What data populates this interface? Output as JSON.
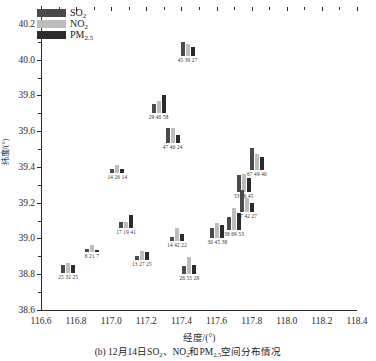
{
  "chart_data": {
    "type": "scatter",
    "title": "",
    "caption_prefix": "(b) 12月14日SO",
    "caption_mid": "、NO",
    "caption_suffix": "和PM",
    "caption_tail": "空间分布情况",
    "xlabel": "经度/(°)",
    "ylabel": "纬度/(°)",
    "xlim": [
      116.6,
      118.4
    ],
    "ylim": [
      38.6,
      40.3
    ],
    "xticks": [
      "116.6",
      "116.8",
      "117.0",
      "117.2",
      "117.4",
      "117.6",
      "117.8",
      "118.0",
      "118.2",
      "118.4"
    ],
    "yticks": [
      "38.6",
      "38.8",
      "39.0",
      "39.2",
      "39.4",
      "39.6",
      "39.8",
      "40.0",
      "40.2"
    ],
    "grid": false,
    "legend_position": "top-left",
    "series": [
      {
        "name": "SO",
        "sub": "2",
        "color": "#4a4a4a"
      },
      {
        "name": "NO",
        "sub": "2",
        "color": "#bdbdbd"
      },
      {
        "name": "PM",
        "sub": "2.5",
        "color": "#2b2b2b"
      }
    ],
    "value_max": 69,
    "points": [
      {
        "lon": 116.755,
        "lat": 38.805,
        "label": "25 32 25",
        "values": [
          25,
          32,
          25
        ]
      },
      {
        "lon": 116.89,
        "lat": 38.925,
        "label": "8 21 7",
        "values": [
          8,
          21,
          7
        ]
      },
      {
        "lon": 117.035,
        "lat": 39.365,
        "label": "14 26 14",
        "values": [
          14,
          26,
          14
        ]
      },
      {
        "lon": 117.085,
        "lat": 39.06,
        "label": "17 19 41",
        "values": [
          17,
          19,
          41
        ]
      },
      {
        "lon": 117.175,
        "lat": 38.88,
        "label": "13 27 25",
        "values": [
          13,
          27,
          25
        ]
      },
      {
        "lon": 117.27,
        "lat": 39.7,
        "label": "29 40 58",
        "values": [
          29,
          40,
          58
        ]
      },
      {
        "lon": 117.35,
        "lat": 39.535,
        "label": "47 46 24",
        "values": [
          47,
          46,
          24
        ]
      },
      {
        "lon": 117.375,
        "lat": 38.985,
        "label": "14 42 22",
        "values": [
          14,
          42,
          22
        ]
      },
      {
        "lon": 117.435,
        "lat": 40.02,
        "label": "45 39 27",
        "values": [
          45,
          39,
          27
        ]
      },
      {
        "lon": 117.445,
        "lat": 38.8,
        "label": "26 55 28",
        "values": [
          26,
          55,
          28
        ]
      },
      {
        "lon": 117.605,
        "lat": 39.005,
        "label": "30 45 38",
        "values": [
          30,
          45,
          38
        ]
      },
      {
        "lon": 117.7,
        "lat": 39.05,
        "label": "38 69 53",
        "values": [
          38,
          69,
          53
        ]
      },
      {
        "lon": 117.755,
        "lat": 39.26,
        "label": "53 56 45",
        "values": [
          53,
          56,
          45
        ]
      },
      {
        "lon": 117.775,
        "lat": 39.15,
        "label": "67 42 27",
        "values": [
          67,
          42,
          27
        ]
      },
      {
        "lon": 117.83,
        "lat": 39.385,
        "label": "67 49 40",
        "values": [
          67,
          49,
          40
        ]
      }
    ]
  }
}
